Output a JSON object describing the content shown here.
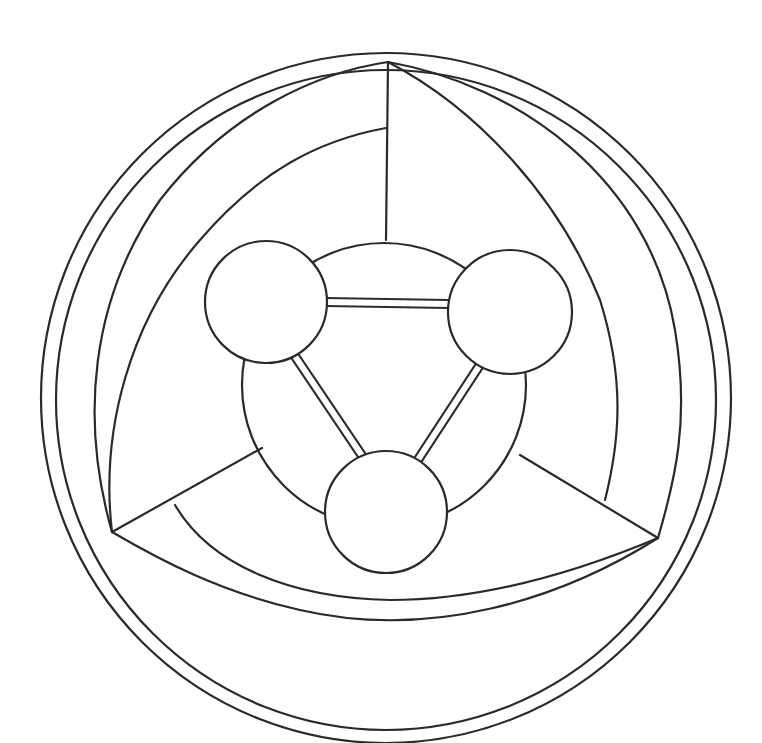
{
  "drawing": {
    "description": "Hand-drawn line art: molecule-like triangle of three circles joined by double bonds inside a ring, surrounded by a three-bladed swirl within a double outer circle",
    "colors": {
      "stroke": "#2a2a2a",
      "background": "#ffffff"
    },
    "outer_rings": [
      {
        "cx": 386,
        "cy": 398,
        "r": 345
      },
      {
        "cx": 386,
        "cy": 400,
        "r": 330
      }
    ],
    "inner_ring": {
      "cx": 384,
      "cy": 385,
      "r": 142
    },
    "nodes": [
      {
        "id": "left",
        "cx": 266,
        "cy": 302,
        "r": 61
      },
      {
        "id": "right",
        "cx": 510,
        "cy": 312,
        "r": 62
      },
      {
        "id": "bottom",
        "cx": 386,
        "cy": 512,
        "r": 61
      }
    ],
    "blades": [
      {
        "id": "top"
      },
      {
        "id": "bottom-left"
      },
      {
        "id": "bottom-right"
      }
    ]
  }
}
